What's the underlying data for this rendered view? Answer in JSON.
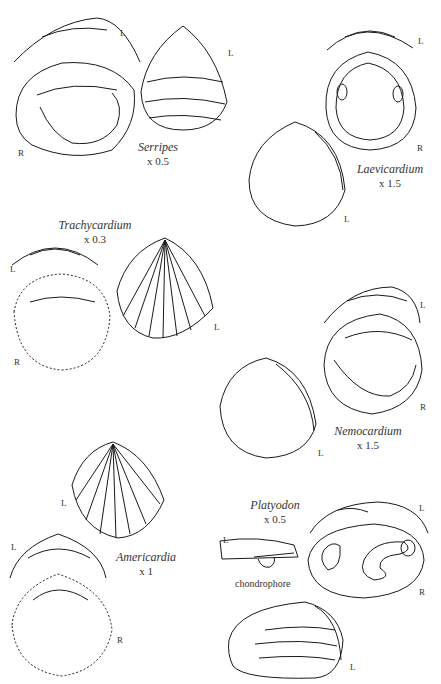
{
  "figure": {
    "species": [
      {
        "genus": "Serripes",
        "magnification": "x 0.5",
        "valve_labels": [
          "L",
          "R",
          "L"
        ]
      },
      {
        "genus": "Laevicardium",
        "magnification": "x 1.5",
        "valve_labels": [
          "L",
          "R",
          "L"
        ]
      },
      {
        "genus": "Trachycardium",
        "magnification": "x 0.3",
        "valve_labels": [
          "L",
          "R",
          "L"
        ]
      },
      {
        "genus": "Nemocardium",
        "magnification": "x 1.5",
        "valve_labels": [
          "L",
          "R",
          "L"
        ]
      },
      {
        "genus": "Americardia",
        "magnification": "x 1",
        "valve_labels": [
          "L",
          "L",
          "R"
        ]
      },
      {
        "genus": "Platyodon",
        "magnification": "x 0.5",
        "valve_labels": [
          "L",
          "L",
          "R",
          "L"
        ]
      }
    ],
    "annotations": {
      "chondrophore": "chondrophore"
    },
    "valve": {
      "left": "L",
      "right": "R"
    }
  }
}
